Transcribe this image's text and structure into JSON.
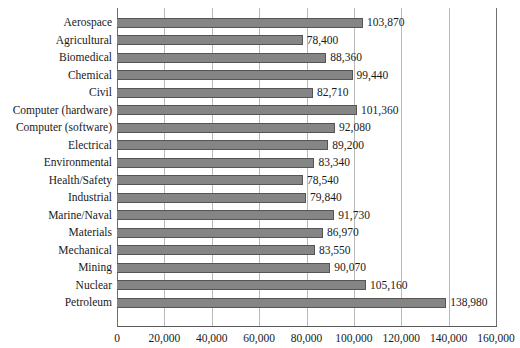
{
  "chart_data": {
    "type": "bar",
    "orientation": "horizontal",
    "title": "",
    "subtitle": "",
    "xlabel": "",
    "ylabel": "",
    "xlim": [
      0,
      160000
    ],
    "xticks": [
      0,
      20000,
      40000,
      60000,
      80000,
      100000,
      120000,
      140000,
      160000
    ],
    "xtick_labels": [
      "0",
      "20,000",
      "40,000",
      "60,000",
      "80,000",
      "100,000",
      "120,000",
      "140,000",
      "160,000"
    ],
    "grid": "vertical",
    "legend": null,
    "categories": [
      "Aerospace",
      "Agricultural",
      "Biomedical",
      "Chemical",
      "Civil",
      "Computer (hardware)",
      "Computer (software)",
      "Electrical",
      "Environmental",
      "Health/Safety",
      "Industrial",
      "Marine/Naval",
      "Materials",
      "Mechanical",
      "Mining",
      "Nuclear",
      "Petroleum"
    ],
    "values": [
      103870,
      78400,
      88360,
      99440,
      82710,
      101360,
      92080,
      89200,
      83340,
      78540,
      79840,
      91730,
      86970,
      83550,
      90070,
      105160,
      138980
    ],
    "data_labels": [
      "103,870",
      "78,400",
      "88,360",
      "99,440",
      "82,710",
      "101,360",
      "92,080",
      "89,200",
      "83,340",
      "78,540",
      "79,840",
      "91,730",
      "86,970",
      "83,550",
      "90,070",
      "105,160",
      "138,980"
    ],
    "colors": {
      "bar_fill": "#858585",
      "bar_edge": "#555555",
      "gridline": "#b9b9b9",
      "axis": "#5a5a5a",
      "text": "#1a1a1a",
      "background": "#ffffff"
    }
  }
}
